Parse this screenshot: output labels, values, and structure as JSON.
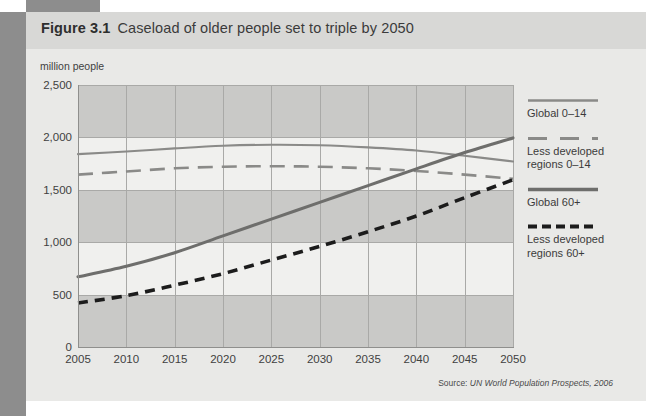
{
  "figure": {
    "number": "Figure 3.1",
    "title": "Caseload of older people set to triple by 2050",
    "source_prefix": "Source:",
    "source": "UN World Population Prospects, 2006"
  },
  "axis": {
    "unit_label": "million people",
    "y_ticks": [
      "2,500",
      "2,000",
      "1,500",
      "1,000",
      "500",
      "0"
    ],
    "x_ticks": [
      "2005",
      "2010",
      "2015",
      "2020",
      "2025",
      "2030",
      "2035",
      "2040",
      "2045",
      "2050"
    ]
  },
  "legend": {
    "items": [
      {
        "label": "Global 0–14",
        "style": "solid-thin-gray",
        "color": "#8a8a88"
      },
      {
        "label": "Less developed\nregions 0–14",
        "style": "dashed-thin-gray",
        "color": "#8a8a88"
      },
      {
        "label": "Global 60+",
        "style": "solid-thick-gray",
        "color": "#6e6e6c"
      },
      {
        "label": "Less developed\nregions 60+",
        "style": "dashed-thick-black",
        "color": "#1c1c1c"
      }
    ]
  },
  "colors": {
    "page_edge": "#8d8d8d",
    "panel": "#e9e9e7",
    "title_band": "#d8d8d6",
    "band_dark": "#c9c9c7",
    "band_light": "#f0f0ee",
    "gridline": "#a9a9a7",
    "series_thin_gray": "#8a8a88",
    "series_thick_gray": "#6e6e6c",
    "series_black": "#1c1c1c"
  },
  "chart_data": {
    "type": "line",
    "title": "Caseload of older people set to triple by 2050",
    "xlabel": "",
    "ylabel": "million people",
    "ylim": [
      0,
      2500
    ],
    "ytick_step": 500,
    "grid": true,
    "legend_position": "right",
    "x": [
      2005,
      2010,
      2015,
      2020,
      2025,
      2030,
      2035,
      2040,
      2045,
      2050
    ],
    "series": [
      {
        "name": "Global 0–14",
        "values": [
          1840,
          1865,
          1895,
          1920,
          1930,
          1925,
          1905,
          1875,
          1825,
          1770
        ]
      },
      {
        "name": "Less developed regions 0–14",
        "values": [
          1645,
          1675,
          1705,
          1720,
          1725,
          1720,
          1705,
          1680,
          1645,
          1605
        ]
      },
      {
        "name": "Global 60+",
        "values": [
          670,
          770,
          900,
          1060,
          1220,
          1380,
          1540,
          1700,
          1855,
          1995
        ]
      },
      {
        "name": "Less developed regions 60+",
        "values": [
          420,
          490,
          590,
          700,
          830,
          960,
          1100,
          1250,
          1425,
          1595
        ]
      }
    ]
  }
}
